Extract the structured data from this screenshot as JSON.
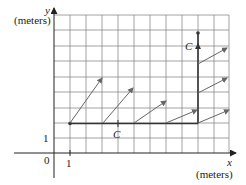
{
  "diagram": {
    "y_axis": {
      "variable": "y",
      "unit": "(meters)"
    },
    "x_axis": {
      "variable": "x",
      "unit": "(meters)"
    },
    "origin_label": "0",
    "x_tick_label": "1",
    "y_tick_label": "1",
    "curve_label_bottom": "C",
    "curve_label_top": "C",
    "colors": {
      "grid": "#8a8a8a",
      "axis": "#222222",
      "curve": "#333333",
      "arrow": "#666666"
    },
    "grid": {
      "x_min": 0,
      "x_max": 11,
      "y_min": 0,
      "y_max": 9
    },
    "curve_C": {
      "horizontal_segment": {
        "from": [
          1,
          2
        ],
        "to": [
          9,
          2
        ]
      },
      "vertical_segment": {
        "from": [
          9,
          2
        ],
        "to": [
          9,
          7.8
        ]
      }
    },
    "vector_field_arrows": [
      {
        "from": [
          1,
          2
        ],
        "to": [
          3.1,
          5
        ]
      },
      {
        "from": [
          3.1,
          2
        ],
        "to": [
          5,
          4.3
        ]
      },
      {
        "from": [
          5,
          2
        ],
        "to": [
          7.1,
          3.4
        ]
      },
      {
        "from": [
          7.1,
          2
        ],
        "to": [
          9,
          2.8
        ]
      },
      {
        "from": [
          9,
          2
        ],
        "to": [
          11,
          2.8
        ]
      },
      {
        "from": [
          9,
          3.8
        ],
        "to": [
          10.8,
          4.8
        ]
      },
      {
        "from": [
          9,
          5.7
        ],
        "to": [
          10.8,
          6.8
        ]
      }
    ]
  }
}
